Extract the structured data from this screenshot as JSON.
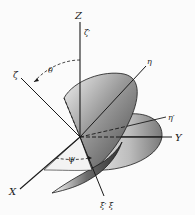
{
  "diagram": {
    "axes": {
      "z": "Z",
      "y": "Y",
      "x": "X",
      "zeta_prime": "ζ′",
      "zeta": "ζ",
      "eta": "η",
      "eta_prime": "η′",
      "xi_prime_xi": "ξ′ ξ"
    },
    "angles": {
      "theta": "θ",
      "psi": "ψ"
    },
    "colors": {
      "background": "#fbfbfb",
      "line": "#1a1a1a",
      "surface_light": "#e6e6e6",
      "surface_dark": "#555555"
    }
  }
}
